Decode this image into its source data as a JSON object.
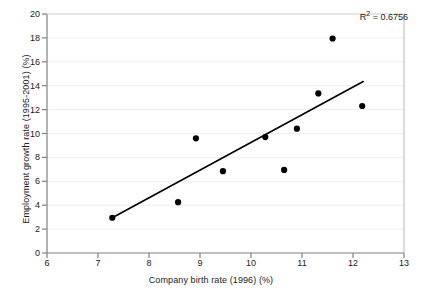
{
  "chart_data": {
    "type": "scatter",
    "title": "",
    "xlabel": "Company birth rate (1996) (%)",
    "ylabel": "Employment growth rate (1995-2001) (%)",
    "xlim": [
      6,
      13
    ],
    "ylim": [
      0,
      20
    ],
    "xticks": [
      6,
      7,
      8,
      9,
      10,
      11,
      12,
      13
    ],
    "yticks": [
      0,
      2,
      4,
      6,
      8,
      10,
      12,
      14,
      16,
      18,
      20
    ],
    "grid": "horizontal-light",
    "legend": "none",
    "annotations": [
      {
        "name": "r-squared",
        "text_prefix": "R",
        "text_sup": "2",
        "text_suffix": " = 0.6756",
        "value": 0.6756
      }
    ],
    "points": [
      {
        "x": 7.28,
        "y": 2.95
      },
      {
        "x": 8.57,
        "y": 4.25
      },
      {
        "x": 8.92,
        "y": 9.6
      },
      {
        "x": 9.45,
        "y": 6.85
      },
      {
        "x": 10.28,
        "y": 9.7
      },
      {
        "x": 10.65,
        "y": 6.95
      },
      {
        "x": 10.9,
        "y": 10.4
      },
      {
        "x": 11.32,
        "y": 13.35
      },
      {
        "x": 11.6,
        "y": 17.95
      },
      {
        "x": 12.18,
        "y": 12.3
      }
    ],
    "trendline": {
      "type": "linear",
      "x_start": 7.28,
      "y_start": 2.95,
      "x_end": 12.2,
      "y_end": 14.35
    },
    "colors": {
      "marker": "#000000",
      "trendline": "#000000",
      "axis": "#808080",
      "grid": "#ededed",
      "text": "#1a1a1a",
      "background": "#ffffff"
    }
  }
}
